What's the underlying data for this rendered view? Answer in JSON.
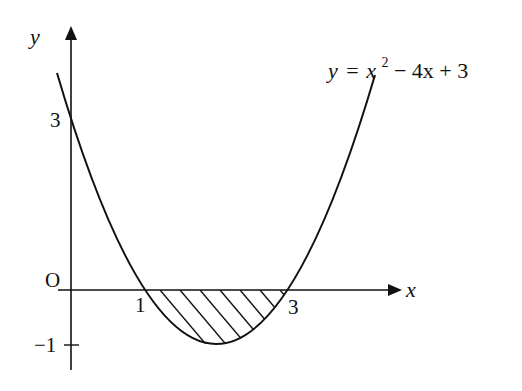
{
  "figure": {
    "type": "function-graph",
    "function_label": {
      "y": "y",
      "eq": "=",
      "x": "x",
      "exp": "2",
      "rest": " − 4x + 3"
    },
    "axes": {
      "x_label": "x",
      "y_label": "y",
      "origin_label": "O"
    },
    "ticks": {
      "x_one": "1",
      "x_three": "3",
      "y_three": "3",
      "y_neg_one": "−1"
    },
    "shaded_region": {
      "description": "Region between the parabola and the x-axis from x=1 to x=3, hatched",
      "x_from": 1,
      "x_to": 3
    },
    "colors": {
      "stroke": "#111111",
      "background": "#ffffff"
    }
  }
}
